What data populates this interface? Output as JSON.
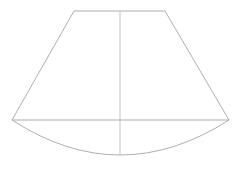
{
  "canvas": {
    "width": 243,
    "height": 169,
    "background_color": "#ffffff",
    "title": "Conical frustum lateral surface diagram"
  },
  "style": {
    "line_color": "#9a9a9a",
    "line_color_secondary": "#b4b4b4",
    "line_width": 0.8,
    "fill": "none"
  },
  "figure": {
    "name": "truncated-cone-development",
    "vertices": {
      "top_left": {
        "x": 74,
        "y": 11
      },
      "top_right": {
        "x": 165,
        "y": 11
      },
      "bottom_left": {
        "x": 12,
        "y": 120
      },
      "bottom_right": {
        "x": 229,
        "y": 120
      }
    },
    "axis": {
      "name": "vertical-centre-axis",
      "x": 120,
      "y_top": 11,
      "y_bottom": 155
    },
    "arc": {
      "name": "bottom-concave-arc",
      "start": {
        "x": 12,
        "y": 120
      },
      "end": {
        "x": 229,
        "y": 120
      },
      "lowest_point": {
        "x": 120,
        "y": 155
      },
      "sagitta": 35,
      "direction": "downward"
    },
    "edges": [
      {
        "name": "top-edge",
        "from": "top_left",
        "to": "top_right",
        "length_px": 91
      },
      {
        "name": "left-slant-edge",
        "from": "top_left",
        "to": "bottom_left"
      },
      {
        "name": "right-slant-edge",
        "from": "top_right",
        "to": "bottom_right"
      },
      {
        "name": "base-chord",
        "from": "bottom_left",
        "to": "bottom_right",
        "length_px": 217
      }
    ]
  },
  "paths": {
    "trapezoid": "M 74 11 L 165 11 L 229 120 L 12 120 Z",
    "arc": "M 12 120 Q 120 190 229 120",
    "axis": "M 120 11 L 120 155"
  }
}
